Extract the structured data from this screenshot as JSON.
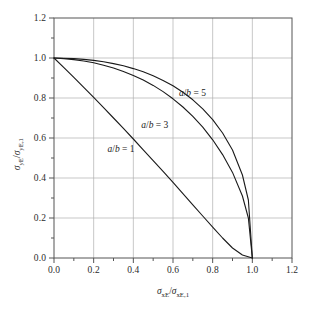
{
  "chart_data": {
    "type": "line",
    "title": "",
    "subtitle": "",
    "xlabel": "sigma_xE / sigma_xE,1",
    "ylabel": "sigma_yE / sigma_yE,1",
    "xlim": [
      0.0,
      1.2
    ],
    "ylim": [
      0.0,
      1.2
    ],
    "xticks": [
      "0.0",
      "0.2",
      "0.4",
      "0.6",
      "0.8",
      "1.0",
      "1.2"
    ],
    "yticks": [
      "0.0",
      "0.2",
      "0.4",
      "0.6",
      "0.8",
      "1.0",
      "1.2"
    ],
    "xtick_values": [
      0.0,
      0.2,
      0.4,
      0.6,
      0.8,
      1.0,
      1.2
    ],
    "ytick_values": [
      0.0,
      0.2,
      0.4,
      0.6,
      0.8,
      1.0,
      1.2
    ],
    "minor_ticks": true,
    "grid": true,
    "grid_color": "#b0b0b0",
    "legend_position": "inline-annotations",
    "line_color": "#1a1a1a",
    "series": [
      {
        "name": "a/b = 1",
        "label": "a/b = 1",
        "x": [
          0.0,
          0.05,
          0.1,
          0.15,
          0.2,
          0.25,
          0.3,
          0.35,
          0.4,
          0.45,
          0.5,
          0.55,
          0.6,
          0.65,
          0.7,
          0.75,
          0.8,
          0.85,
          0.9,
          0.95,
          1.0
        ],
        "y": [
          1.0,
          0.952,
          0.903,
          0.853,
          0.803,
          0.752,
          0.7,
          0.648,
          0.595,
          0.541,
          0.487,
          0.433,
          0.378,
          0.322,
          0.266,
          0.21,
          0.154,
          0.1,
          0.05,
          0.015,
          0.0
        ]
      },
      {
        "name": "a/b = 3",
        "label": "a/b = 3",
        "x": [
          0.0,
          0.05,
          0.1,
          0.15,
          0.2,
          0.25,
          0.3,
          0.35,
          0.4,
          0.45,
          0.5,
          0.55,
          0.6,
          0.65,
          0.7,
          0.75,
          0.8,
          0.85,
          0.9,
          0.95,
          0.98,
          1.0
        ],
        "y": [
          1.0,
          0.997,
          0.992,
          0.985,
          0.976,
          0.964,
          0.95,
          0.933,
          0.913,
          0.89,
          0.863,
          0.832,
          0.796,
          0.755,
          0.708,
          0.654,
          0.591,
          0.517,
          0.428,
          0.31,
          0.2,
          0.0
        ]
      },
      {
        "name": "a/b = 5",
        "label": "a/b = 5",
        "x": [
          0.0,
          0.05,
          0.1,
          0.15,
          0.2,
          0.25,
          0.3,
          0.35,
          0.4,
          0.45,
          0.5,
          0.55,
          0.6,
          0.65,
          0.7,
          0.75,
          0.8,
          0.85,
          0.9,
          0.95,
          0.98,
          1.0
        ],
        "y": [
          1.0,
          0.999,
          0.997,
          0.993,
          0.988,
          0.981,
          0.972,
          0.961,
          0.947,
          0.931,
          0.911,
          0.888,
          0.861,
          0.829,
          0.791,
          0.746,
          0.692,
          0.625,
          0.54,
          0.415,
          0.29,
          0.0
        ]
      }
    ],
    "annotations": [
      {
        "text": "a/b = 5",
        "x": 0.63,
        "y": 0.82
      },
      {
        "text": "a/b = 3",
        "x": 0.44,
        "y": 0.66
      },
      {
        "text": "a/b = 1",
        "x": 0.27,
        "y": 0.54
      }
    ]
  },
  "axis": {
    "x_title_parts": {
      "sigma": "σ",
      "sub1": "xE",
      "slash": "/",
      "sigma2": "σ",
      "sub2": "xE,1"
    },
    "y_title_parts": {
      "sigma": "σ",
      "sub1": "yE",
      "slash": "/",
      "sigma2": "σ",
      "sub2": "yE,1"
    }
  }
}
